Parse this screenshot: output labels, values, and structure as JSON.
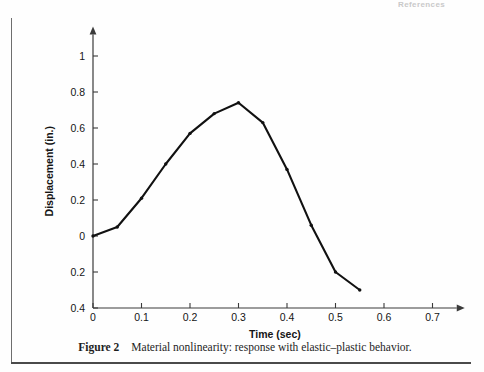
{
  "page": {
    "running_head": "References"
  },
  "caption": {
    "prefix": "Figure 2",
    "text": "Material nonlinearity: response with elastic–plastic behavior."
  },
  "chart_data": {
    "type": "line",
    "title": "",
    "xlabel": "Time (sec)",
    "ylabel": "Displacement (in.)",
    "xlim": [
      0,
      0.75
    ],
    "ylim": [
      -0.4,
      1.12
    ],
    "grid": false,
    "legend": "none",
    "line_color": "#111111",
    "marker": "dot",
    "xticks": [
      0,
      0.1,
      0.2,
      0.3,
      0.4,
      0.5,
      0.6,
      0.7
    ],
    "xtick_labels": [
      "0",
      "0.1",
      "0.2",
      "0.3",
      "0.4",
      "0.5",
      "0.6",
      "0.7"
    ],
    "yticks": [
      1,
      0.8,
      0.6,
      0.4,
      0.2,
      0,
      -0.2,
      -0.4
    ],
    "ytick_labels": [
      "1",
      "0.8",
      "0.6",
      "0.4",
      "0.2",
      "0",
      "0.2",
      "0.4"
    ],
    "x": [
      0,
      0.05,
      0.1,
      0.15,
      0.2,
      0.25,
      0.3,
      0.35,
      0.4,
      0.45,
      0.5,
      0.55
    ],
    "values": [
      0,
      0.05,
      0.21,
      0.4,
      0.57,
      0.68,
      0.74,
      0.63,
      0.37,
      0.06,
      -0.2,
      -0.3
    ],
    "series": [
      {
        "name": "elastic-plastic response",
        "x": [
          0,
          0.05,
          0.1,
          0.15,
          0.2,
          0.25,
          0.3,
          0.35,
          0.4,
          0.45,
          0.5,
          0.55
        ],
        "values": [
          0,
          0.05,
          0.21,
          0.4,
          0.57,
          0.68,
          0.74,
          0.63,
          0.37,
          0.06,
          -0.2,
          -0.3
        ]
      }
    ]
  }
}
